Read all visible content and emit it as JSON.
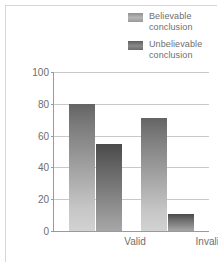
{
  "chart_data": {
    "type": "bar",
    "title": "",
    "xlabel": "",
    "ylabel": "Percent conclusions accepted",
    "categories": [
      "Valid",
      "Invalid"
    ],
    "series": [
      {
        "name": "Believable conclusion",
        "values": [
          80,
          71
        ],
        "color": "#a7a7a7"
      },
      {
        "name": "Unbelievable conclusion",
        "values": [
          55,
          11
        ],
        "color": "#6b6b6b"
      }
    ],
    "ylim": [
      0,
      100
    ],
    "yticks": [
      0,
      20,
      40,
      60,
      80,
      100
    ],
    "ytick_labels": [
      "0",
      "20",
      "40",
      "60",
      "80",
      "100"
    ],
    "grid": true,
    "legend_position": "top-right"
  },
  "legend": {
    "items": [
      {
        "label_line1": "Believable",
        "label_line2": "conclusion",
        "swatch": "believable-swatch"
      },
      {
        "label_line1": "Unbelievable",
        "label_line2": "conclusion",
        "swatch": "unbelievable-swatch"
      }
    ]
  },
  "axes": {
    "y_title": "Percent conclusions accepted",
    "y_labels": {
      "t0": "0",
      "t20": "20",
      "t40": "40",
      "t60": "60",
      "t80": "80",
      "t100": "100"
    },
    "x_labels": {
      "c0": "Valid",
      "c1": "Invalid"
    }
  }
}
